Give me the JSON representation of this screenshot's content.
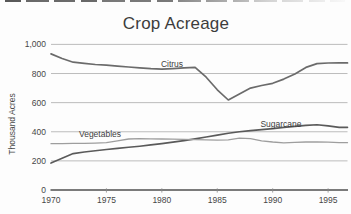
{
  "chart_data": {
    "type": "line",
    "title": "Crop Acreage",
    "xlabel": "",
    "ylabel": "Thousand Acres",
    "x": [
      1970,
      1971,
      1972,
      1973,
      1974,
      1975,
      1976,
      1977,
      1978,
      1979,
      1980,
      1981,
      1982,
      1983,
      1984,
      1985,
      1986,
      1987,
      1988,
      1989,
      1990,
      1991,
      1992,
      1993,
      1994,
      1995,
      1996
    ],
    "series": [
      {
        "name": "Citrus",
        "values": [
          935,
          903,
          878,
          870,
          862,
          857,
          851,
          845,
          839,
          833,
          830,
          834,
          839,
          843,
          775,
          688,
          618,
          660,
          700,
          718,
          733,
          762,
          797,
          842,
          868,
          872,
          873
        ],
        "color": "#6b6b6b",
        "line_width": 1.7,
        "label_pos": {
          "x": 172,
          "y": 67
        }
      },
      {
        "name": "Sugarcane",
        "values": [
          185,
          218,
          250,
          261,
          270,
          278,
          286,
          293,
          301,
          310,
          319,
          329,
          339,
          351,
          364,
          377,
          390,
          400,
          408,
          415,
          422,
          430,
          437,
          444,
          448,
          440,
          430
        ],
        "color": "#5a5a5a",
        "line_width": 1.6,
        "label_pos": {
          "x": 281,
          "y": 126.5
        }
      },
      {
        "name": "Vegetables",
        "values": [
          318,
          319,
          320,
          321,
          322,
          325,
          338,
          350,
          352,
          351,
          350,
          349,
          348,
          346,
          345,
          343,
          344,
          356,
          352,
          338,
          330,
          324,
          327,
          330,
          330,
          328,
          325
        ],
        "color": "#9e9e9e",
        "line_width": 1.3,
        "label_pos": {
          "x": 100,
          "y": 137
        }
      }
    ],
    "yticks": [
      0,
      200,
      400,
      600,
      800,
      1000
    ],
    "ytick_labels": [
      "0",
      "200",
      "400",
      "600",
      "800",
      "1,000"
    ],
    "xticks": [
      1970,
      1975,
      1980,
      1985,
      1990,
      1995
    ],
    "xtick_labels": [
      "1970",
      "1975",
      "1980",
      "1985",
      "1990",
      "1995"
    ],
    "xlim": [
      1970,
      1996.75
    ],
    "ylim": [
      0,
      1050
    ],
    "grid": true,
    "legend_position": "inline-labels",
    "grid_color": "#b4b4b4",
    "axis_color": "#4f4f4f",
    "tick_color": "#8a8a8a"
  }
}
